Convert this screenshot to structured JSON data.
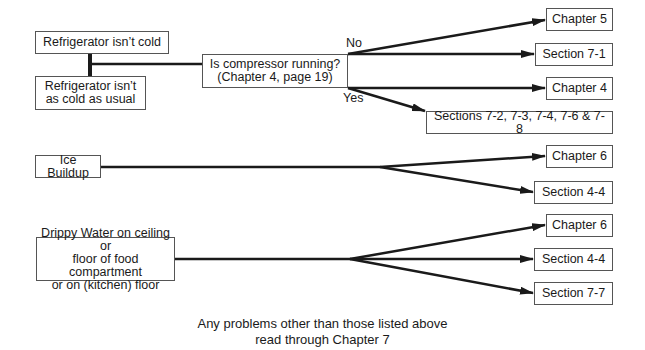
{
  "groups": [
    {
      "symptoms": [
        "Refrigerator isn’t cold",
        "Refrigerator isn’t\nas cold as usual"
      ],
      "question": "Is compressor running?\n(Chapter 4, page 19)",
      "no_label": "No",
      "yes_label": "Yes",
      "no_targets": [
        "Chapter 5",
        "Section 7-1"
      ],
      "yes_targets": [
        "Chapter 4",
        "Sections 7-2, 7-3, 7-4, 7-6 & 7-8"
      ]
    },
    {
      "symptom": "Ice Buildup",
      "targets": [
        "Chapter 6",
        "Section 4-4"
      ]
    },
    {
      "symptom": "Drippy Water on ceiling or\nfloor of food compartment\nor on (kitchen) floor",
      "targets": [
        "Chapter 6",
        "Section 4-4",
        "Section 7-7"
      ]
    }
  ],
  "footer": "Any problems other than those listed above\nread through Chapter 7",
  "colors": {
    "line": "#1a1a1a",
    "border": "#555555"
  }
}
